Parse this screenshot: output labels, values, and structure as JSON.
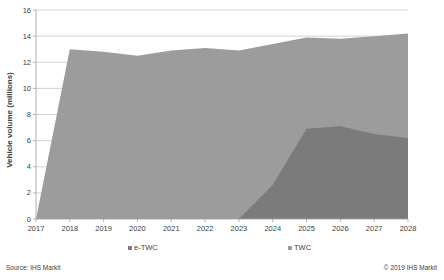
{
  "chart_data": {
    "type": "area",
    "stacked": false,
    "title": "",
    "xlabel": "",
    "ylabel": "Vehicle volume (millions)",
    "x": [
      "2017",
      "2018",
      "2019",
      "2020",
      "2021",
      "2022",
      "2023",
      "2024",
      "2025",
      "2026",
      "2027",
      "2028"
    ],
    "ylim": [
      0,
      16
    ],
    "yticks": [
      0,
      2,
      4,
      6,
      8,
      10,
      12,
      14,
      16
    ],
    "grid": true,
    "legend_position": "bottom",
    "series": [
      {
        "name": "TWC",
        "color": "#9c9c9c",
        "values": [
          0,
          13.0,
          12.8,
          12.5,
          12.9,
          13.1,
          12.9,
          13.4,
          13.9,
          13.8,
          14.0,
          14.2
        ]
      },
      {
        "name": "e-TWC",
        "color": "#7b7b7b",
        "values": [
          0,
          0,
          0,
          0,
          0,
          0,
          0,
          2.6,
          6.9,
          7.1,
          6.5,
          6.2
        ]
      }
    ]
  },
  "legend": {
    "items": [
      {
        "label": "e-TWC",
        "color": "#7b7b7b"
      },
      {
        "label": "TWC",
        "color": "#9c9c9c"
      }
    ]
  },
  "footer": {
    "source": "Source: IHS Markit",
    "copyright": "© 2019 IHS Markit"
  }
}
